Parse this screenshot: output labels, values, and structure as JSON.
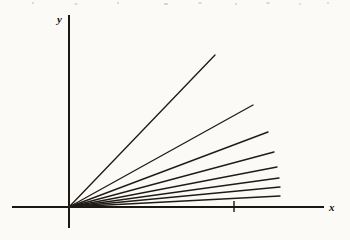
{
  "figure": {
    "kind": "line",
    "background_color": "#fbfaf7",
    "ink_color": "#1b1814",
    "y_axis_label": "y",
    "x_axis_label": "x"
  },
  "chart_data": {
    "type": "line",
    "title": "",
    "subtitle": "",
    "xlabel": "x",
    "ylabel": "y",
    "grid": false,
    "legend": "none",
    "annotations": [
      {
        "name": "x-axis-tick",
        "kind": "tick-mark",
        "x_px": 234,
        "label": ""
      }
    ],
    "axes": {
      "origin_px": {
        "x": 69,
        "y": 207
      },
      "x_axis_px": {
        "x1": 12,
        "y1": 207,
        "x2": 324,
        "y2": 207
      },
      "y_axis_px": {
        "x1": 69,
        "y1": 15,
        "x2": 69,
        "y2": 228
      },
      "xlim_px": [
        12,
        324
      ],
      "ylim_px": [
        228,
        15
      ],
      "arrowheads": false
    },
    "series": [
      {
        "name": "ray-1",
        "slope": 1.041,
        "x_end_px": 215,
        "y_end_px": 55,
        "x_start_px": 69,
        "y_start_px": 207
      },
      {
        "name": "ray-2",
        "slope": 0.554,
        "x_end_px": 253,
        "y_end_px": 105,
        "x_start_px": 69,
        "y_start_px": 207
      },
      {
        "name": "ray-3",
        "slope": 0.378,
        "x_end_px": 268,
        "y_end_px": 132,
        "x_start_px": 69,
        "y_start_px": 207
      },
      {
        "name": "ray-4",
        "slope": 0.267,
        "x_end_px": 274,
        "y_end_px": 152,
        "x_start_px": 69,
        "y_start_px": 207
      },
      {
        "name": "ray-5",
        "slope": 0.194,
        "x_end_px": 277,
        "y_end_px": 167,
        "x_start_px": 69,
        "y_start_px": 207
      },
      {
        "name": "ray-6",
        "slope": 0.139,
        "x_end_px": 279,
        "y_end_px": 178,
        "x_start_px": 69,
        "y_start_px": 207
      },
      {
        "name": "ray-7",
        "slope": 0.095,
        "x_end_px": 280,
        "y_end_px": 187,
        "x_start_px": 69,
        "y_start_px": 207
      },
      {
        "name": "ray-8",
        "slope": 0.052,
        "x_end_px": 280,
        "y_end_px": 196,
        "x_start_px": 69,
        "y_start_px": 207
      }
    ]
  }
}
